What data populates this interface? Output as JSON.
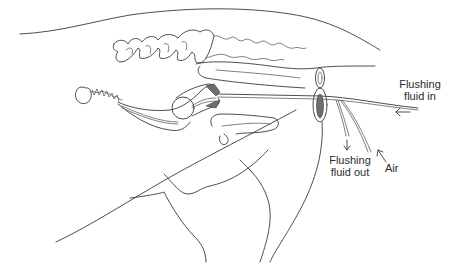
{
  "diagram": {
    "type": "anatomical line drawing",
    "labels": {
      "fluid_in_line1": "Flushing",
      "fluid_in_line2": "fluid in",
      "fluid_out_line1": "Flushing",
      "fluid_out_line2": "fluid out",
      "air": "Air"
    },
    "arrows": [
      {
        "name": "fluid-in-arrow",
        "direction": "left"
      },
      {
        "name": "fluid-out-arrow",
        "direction": "down"
      },
      {
        "name": "air-arrow",
        "direction": "up-left"
      }
    ],
    "colors": {
      "line": "#3a3a3a",
      "shading": "#6e6e6e",
      "background": "#ffffff"
    }
  }
}
